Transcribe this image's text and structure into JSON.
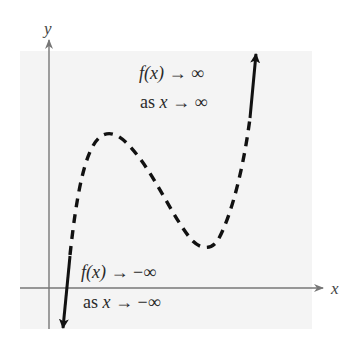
{
  "figure": {
    "axes": {
      "x_label": "x",
      "y_label": "y"
    },
    "annotations": {
      "right_end": {
        "line1_func": "f(x)",
        "line1_rest": " → ∞",
        "line2_prefix": "as ",
        "line2_var": "x",
        "line2_rest": " → ∞"
      },
      "left_end": {
        "line1_func": "f(x)",
        "line1_rest": " → −∞",
        "line2_prefix": "as ",
        "line2_var": "x",
        "line2_rest": " → −∞"
      }
    },
    "curve": {
      "description": "Cubic-like polynomial end behavior: rises to the right, falls to the left",
      "local_max_px": [
        108,
        134
      ],
      "local_min_px": [
        207,
        247
      ],
      "solid_segments": [
        "left end (arrow down)",
        "right end (arrow up)"
      ],
      "dashed_segment": "middle portion"
    },
    "colors": {
      "panel": "#f4f4f4",
      "axis": "#777777",
      "curve": "#111111",
      "text": "#2a2a2a"
    }
  }
}
